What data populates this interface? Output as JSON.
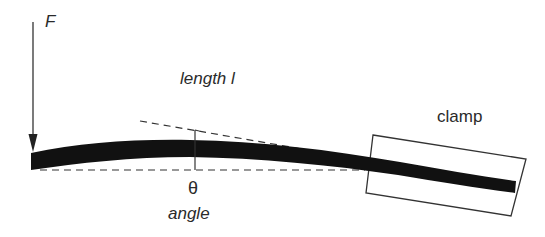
{
  "labels": {
    "force": "F",
    "length": "length l",
    "clamp": "clamp",
    "theta": "θ",
    "angle": "angle"
  },
  "colors": {
    "beam": "#111111",
    "line": "#333333",
    "text": "#2a2a2a",
    "background": "#ffffff"
  }
}
